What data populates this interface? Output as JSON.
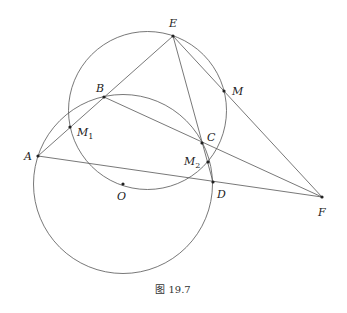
{
  "caption": "图 19.7",
  "points": [
    {
      "id": "A",
      "label": "A",
      "x": 38,
      "y": 156,
      "lx": 24,
      "ly": 160
    },
    {
      "id": "B",
      "label": "B",
      "x": 104,
      "y": 97,
      "lx": 96,
      "ly": 92
    },
    {
      "id": "E",
      "label": "E",
      "x": 173,
      "y": 36,
      "lx": 169,
      "ly": 27
    },
    {
      "id": "M",
      "label": "M",
      "x": 224,
      "y": 91,
      "lx": 232,
      "ly": 95
    },
    {
      "id": "M1",
      "label": "M",
      "sub": "1",
      "x": 70,
      "y": 127,
      "lx": 77,
      "ly": 136
    },
    {
      "id": "C",
      "label": "C",
      "x": 202,
      "y": 143,
      "lx": 207,
      "ly": 141
    },
    {
      "id": "M2",
      "label": "M",
      "sub": "2",
      "x": 208,
      "y": 162,
      "lx": 184,
      "ly": 165
    },
    {
      "id": "D",
      "label": "D",
      "x": 213,
      "y": 182,
      "lx": 217,
      "ly": 198
    },
    {
      "id": "O",
      "label": "O",
      "x": 123,
      "y": 184,
      "lx": 117,
      "ly": 200
    },
    {
      "id": "F",
      "label": "F",
      "x": 322,
      "y": 197,
      "lx": 318,
      "ly": 216
    }
  ],
  "circles": [
    {
      "name": "circle-O",
      "cx": 123,
      "cy": 184,
      "r": 89.5
    },
    {
      "name": "circle-EBC",
      "cx": 147.5,
      "cy": 110.5,
      "r": 79
    }
  ],
  "segments": [
    [
      "A",
      "E"
    ],
    [
      "A",
      "F"
    ],
    [
      "B",
      "F"
    ],
    [
      "E",
      "D"
    ],
    [
      "E",
      "F"
    ]
  ]
}
